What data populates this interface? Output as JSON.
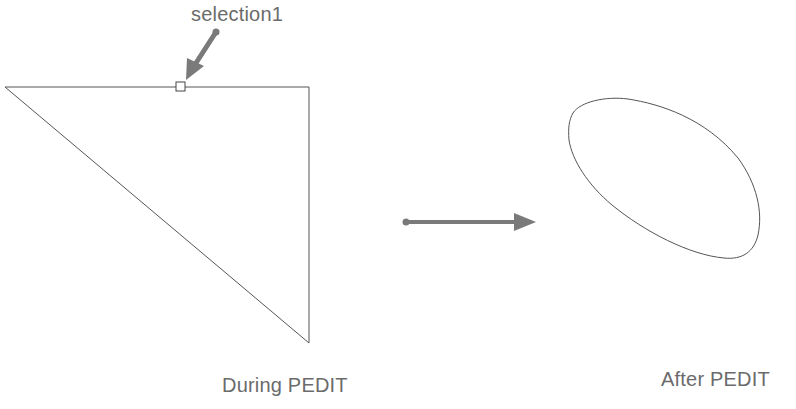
{
  "labels": {
    "selection": "selection1",
    "during": "During PEDIT",
    "after": "After PEDIT"
  },
  "colors": {
    "stroke": "#555555",
    "arrow": "#7a7a7a",
    "text": "#6b6b6b",
    "background": "#ffffff"
  },
  "shapes": {
    "triangle": {
      "vertices": [
        [
          5,
          87
        ],
        [
          309,
          87
        ],
        [
          309,
          343
        ]
      ]
    },
    "selection_grip": {
      "x": 176,
      "y": 82,
      "size": 9
    },
    "spline_blob": {
      "description": "closed smooth curve (polyline converted to spline)"
    }
  }
}
